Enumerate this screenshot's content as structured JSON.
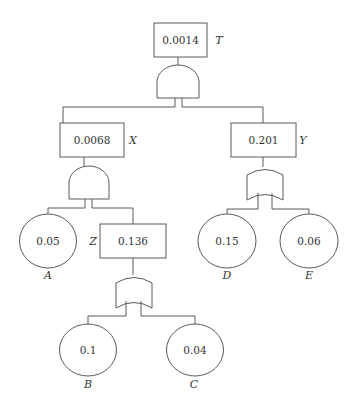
{
  "diagram": {
    "type": "fault-tree",
    "top_event": {
      "id": "T",
      "label": "T",
      "value": "0.0014",
      "gate": "AND"
    },
    "intermediate_events": [
      {
        "id": "X",
        "label": "X",
        "value": "0.0068",
        "gate": "AND"
      },
      {
        "id": "Y",
        "label": "Y",
        "value": "0.201",
        "gate": "OR"
      },
      {
        "id": "Z",
        "label": "Z",
        "value": "0.136",
        "gate": "OR"
      }
    ],
    "basic_events": [
      {
        "id": "A",
        "label": "A",
        "value": "0.05"
      },
      {
        "id": "B",
        "label": "B",
        "value": "0.1"
      },
      {
        "id": "C",
        "label": "C",
        "value": "0.04"
      },
      {
        "id": "D",
        "label": "D",
        "value": "0.15"
      },
      {
        "id": "E",
        "label": "E",
        "value": "0.06"
      }
    ],
    "edges": [
      [
        "T",
        "X"
      ],
      [
        "T",
        "Y"
      ],
      [
        "X",
        "A"
      ],
      [
        "X",
        "Z"
      ],
      [
        "Z",
        "B"
      ],
      [
        "Z",
        "C"
      ],
      [
        "Y",
        "D"
      ],
      [
        "Y",
        "E"
      ]
    ]
  },
  "nodes": {
    "T": {
      "value": "0.0014",
      "label": "T"
    },
    "X": {
      "value": "0.0068",
      "label": "X"
    },
    "Y": {
      "value": "0.201",
      "label": "Y"
    },
    "Z": {
      "value": "0.136",
      "label": "Z"
    },
    "A": {
      "value": "0.05",
      "label": "A"
    },
    "B": {
      "value": "0.1",
      "label": "B"
    },
    "C": {
      "value": "0.04",
      "label": "C"
    },
    "D": {
      "value": "0.15",
      "label": "D"
    },
    "E": {
      "value": "0.06",
      "label": "E"
    }
  }
}
